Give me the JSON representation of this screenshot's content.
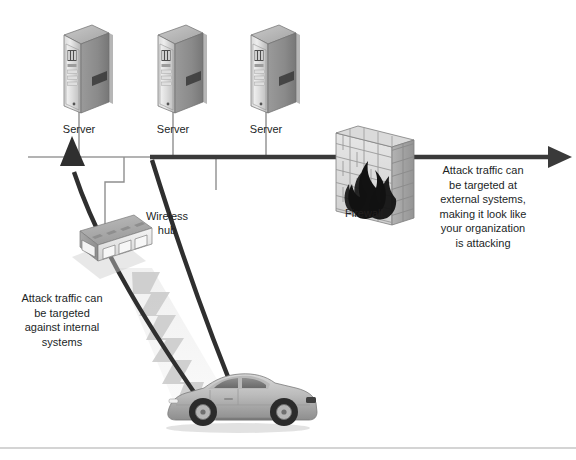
{
  "diagram": {
    "background_color": "#ffffff",
    "line_color_primary": "#3a3a3a",
    "line_color_secondary": "#8c8c8c",
    "text_color": "#221f1f"
  },
  "nodes": {
    "servers": [
      {
        "label": "Server",
        "x": 79
      },
      {
        "label": "Server",
        "x": 173
      },
      {
        "label": "Server",
        "x": 266
      }
    ],
    "wireless_hub": {
      "label": "Wireless\nhub",
      "label_line_1": "Wireless",
      "label_line_2": "hub"
    },
    "firewall": {
      "label": "Firewall"
    },
    "attacker_vehicle": {
      "name": "car"
    }
  },
  "annotations": {
    "internal": {
      "text": "Attack traffic can\nbe targeted\nagainst internal\nsystems"
    },
    "external": {
      "text": "Attack traffic can\nbe targeted at\nexternal systems,\nmaking it look like\nyour organization\nis attacking"
    }
  }
}
